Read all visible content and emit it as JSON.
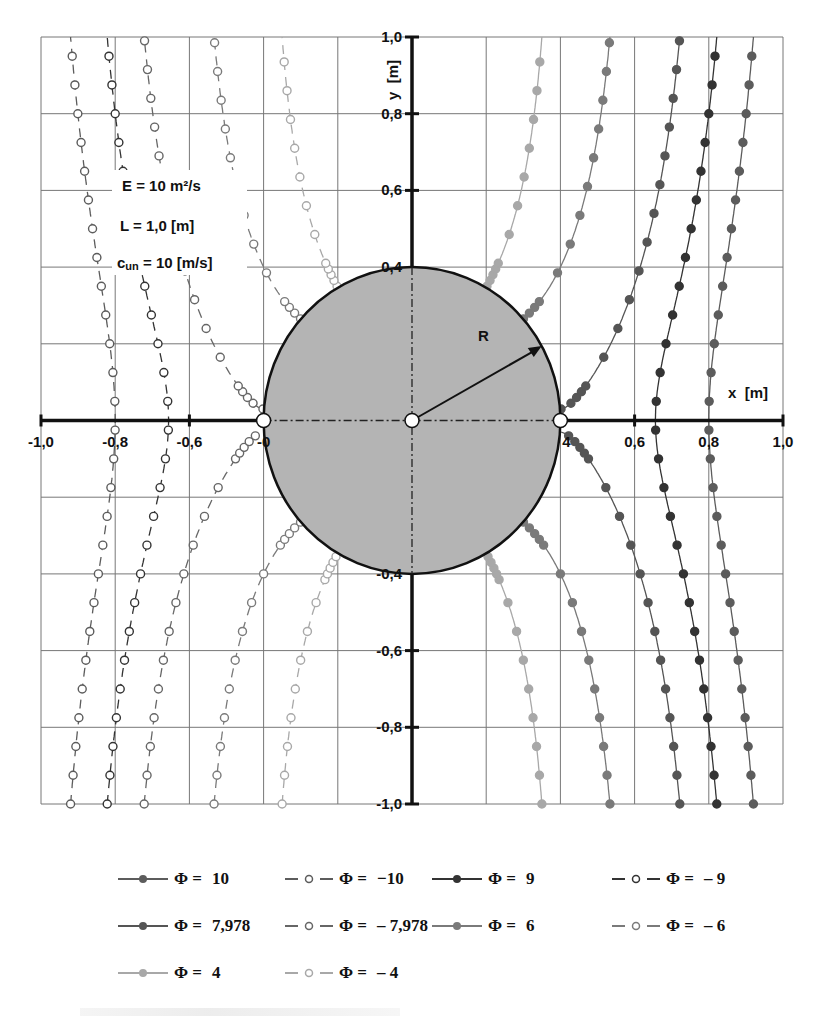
{
  "chart_data": {
    "type": "line",
    "xlabel": "x  [m]",
    "ylabel": "y  [m]",
    "xlim": [
      -1.0,
      1.0
    ],
    "ylim": [
      -1.0,
      1.0
    ],
    "grid": true,
    "x_ticks": [
      "-1,0",
      "-0,8",
      "-0,6",
      "-0",
      "4",
      "0,6",
      "0,8",
      "1,0"
    ],
    "x_tick_values": [
      -1.0,
      -0.8,
      -0.6,
      -0.4,
      0.4,
      0.6,
      0.8,
      1.0
    ],
    "y_ticks": [
      "1,0",
      "0,8",
      "0,6",
      "0,4",
      "-0,4",
      "-0,6",
      "-0,8",
      "-1,0"
    ],
    "y_tick_values": [
      1.0,
      0.8,
      0.6,
      0.4,
      -0.4,
      -0.6,
      -0.8,
      -1.0
    ],
    "grid_step": 0.2,
    "parameters": {
      "E": "E = 10 m²/s",
      "L": "L = 1,0 [m]",
      "c_un_label": "c",
      "c_un_sub": "un",
      "c_un_rest": " = 10   [m/s]"
    },
    "cylinder": {
      "radius": 0.4,
      "label": "R",
      "fill": "#b4b4b4",
      "center": [
        0,
        0
      ]
    },
    "model": {
      "U": 10,
      "R": 0.4,
      "formula": "Φ = U·x·(1 + R²/(x²+y²))"
    },
    "legend_position": "bottom",
    "series": [
      {
        "name": "Φ = 10",
        "phi": 10,
        "style": "solid",
        "marker": "filled",
        "color": "#5c5c5c"
      },
      {
        "name": "Φ = −10",
        "phi": -10,
        "style": "dashed",
        "marker": "open",
        "color": "#5c5c5c"
      },
      {
        "name": "Φ = 9",
        "phi": 9,
        "style": "solid",
        "marker": "filled",
        "color": "#333333"
      },
      {
        "name": "Φ = −9",
        "phi": -9,
        "style": "dashed",
        "marker": "open",
        "color": "#333333"
      },
      {
        "name": "Φ = 7,978",
        "phi": 7.978,
        "style": "solid",
        "marker": "filled",
        "color": "#555555"
      },
      {
        "name": "Φ = −7,978",
        "phi": -7.978,
        "style": "dashed",
        "marker": "open",
        "color": "#666666"
      },
      {
        "name": "Φ = 6",
        "phi": 6,
        "style": "solid",
        "marker": "filled",
        "color": "#7a7a7a"
      },
      {
        "name": "Φ = −6",
        "phi": -6,
        "style": "dashed",
        "marker": "open",
        "color": "#7a7a7a"
      },
      {
        "name": "Φ = 4",
        "phi": 4,
        "style": "solid",
        "marker": "filled",
        "color": "#a8a8a8"
      },
      {
        "name": "Φ = −4",
        "phi": -4,
        "style": "dashed",
        "marker": "open",
        "color": "#a8a8a8"
      }
    ],
    "crossings_y0": {
      "Φ=10": 0.8,
      "Φ=9": 0.656,
      "Φ=-10": -0.8,
      "Φ=-9": -0.656
    }
  },
  "legend": {
    "items": [
      {
        "phi": "Φ =",
        "value": "10",
        "style": "solid",
        "color": "#5c5c5c"
      },
      {
        "phi": "Φ =",
        "value": "−10",
        "style": "dashed",
        "color": "#5c5c5c"
      },
      {
        "phi": "Φ =",
        "value": "9",
        "style": "solid",
        "color": "#333333"
      },
      {
        "phi": "Φ =",
        "value": "– 9",
        "style": "dashed",
        "color": "#333333"
      },
      {
        "phi": "Φ =",
        "value": "7,978",
        "style": "solid",
        "color": "#555555"
      },
      {
        "phi": "Φ =",
        "value": "– 7,978",
        "style": "dashed",
        "color": "#666666"
      },
      {
        "phi": "Φ =",
        "value": "6",
        "style": "solid",
        "color": "#7a7a7a"
      },
      {
        "phi": "Φ =",
        "value": "– 6",
        "style": "dashed",
        "color": "#7a7a7a"
      },
      {
        "phi": "Φ =",
        "value": "4",
        "style": "solid",
        "color": "#a8a8a8"
      },
      {
        "phi": "Φ =",
        "value": "– 4",
        "style": "dashed",
        "color": "#a8a8a8"
      }
    ]
  }
}
